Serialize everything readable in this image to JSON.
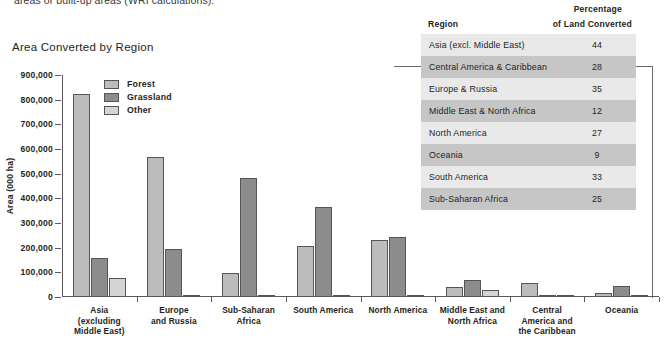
{
  "top_caption": "areas or built-up areas (WRI calculations).",
  "chart": {
    "title": "Area Converted by Region",
    "ylabel": "Area (000 ha)",
    "yticks": [
      "900,000",
      "800,000",
      "700,000",
      "600,000",
      "500,000",
      "400,000",
      "300,000",
      "200,000",
      "100,000",
      "0"
    ],
    "legend": [
      {
        "label": "Forest",
        "key": "forest",
        "color": "#bcbcbc"
      },
      {
        "label": "Grassland",
        "key": "grassland",
        "color": "#8c8c8c"
      },
      {
        "label": "Other",
        "key": "other",
        "color": "#d4d4d4"
      }
    ]
  },
  "chart_data": {
    "type": "bar",
    "title": "Area Converted by Region",
    "xlabel": "",
    "ylabel": "Area (000 ha)",
    "ylim": [
      0,
      900000
    ],
    "ytick_step": 100000,
    "grid": false,
    "legend_position": "top-left-inside",
    "categories": [
      "Asia (excluding Middle East)",
      "Europe and Russia",
      "Sub-Saharan Africa",
      "South America",
      "North America",
      "Middle East and North Africa",
      "Central America and the Caribbean",
      "Oceania"
    ],
    "category_lines": [
      [
        "Asia",
        "(excluding",
        "Middle East)"
      ],
      [
        "Europe",
        "and Russia"
      ],
      [
        "Sub-Saharan",
        "Africa"
      ],
      [
        "South America"
      ],
      [
        "North America"
      ],
      [
        "Middle East and",
        "North Africa"
      ],
      [
        "Central",
        "America and",
        "the Caribbean"
      ],
      [
        "Oceania"
      ]
    ],
    "series": [
      {
        "name": "Forest",
        "color": "#bcbcbc",
        "values": [
          825000,
          568000,
          98000,
          207000,
          233000,
          40000,
          55000,
          15000
        ]
      },
      {
        "name": "Grassland",
        "color": "#8c8c8c",
        "values": [
          158000,
          195000,
          483000,
          365000,
          242000,
          68000,
          10000,
          44000
        ]
      },
      {
        "name": "Other",
        "color": "#d4d4d4",
        "values": [
          78000,
          10000,
          5000,
          8000,
          5000,
          30000,
          4000,
          2000
        ]
      }
    ]
  },
  "table": {
    "header": {
      "region": "Region",
      "percentage_line1": "Percentage",
      "percentage_line2": "of Land Converted"
    },
    "rows": [
      {
        "region": "Asia (excl. Middle East)",
        "percentage": "44"
      },
      {
        "region": "Central America & Caribbean",
        "percentage": "28"
      },
      {
        "region": "Europe & Russia",
        "percentage": "35"
      },
      {
        "region": "Middle East & North Africa",
        "percentage": "12"
      },
      {
        "region": "North America",
        "percentage": "27"
      },
      {
        "region": "Oceania",
        "percentage": "9"
      },
      {
        "region": "South America",
        "percentage": "33"
      },
      {
        "region": "Sub-Saharan Africa",
        "percentage": "25"
      }
    ]
  }
}
